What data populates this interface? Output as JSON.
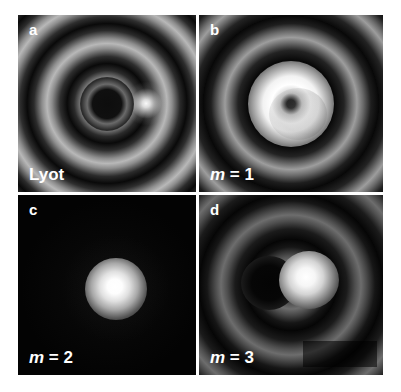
{
  "figure": {
    "background_color": "#ffffff",
    "gutter_color": "#ffffff",
    "layout": "2x2-grid",
    "panel_count": 4
  },
  "panels": [
    {
      "letter": "a",
      "caption": "Lyot",
      "caption_variable": "",
      "caption_value": "",
      "description": "concentric diffraction rings with bright off-axis spot at right"
    },
    {
      "letter": "b",
      "caption": "m = 1",
      "caption_variable": "m",
      "caption_value": "1",
      "description": "bright centered annulus with dark central core"
    },
    {
      "letter": "c",
      "caption": "m = 2",
      "caption_variable": "m",
      "caption_value": "2",
      "description": "dark field with single compact bright spot"
    },
    {
      "letter": "d",
      "caption": "m = 3",
      "caption_variable": "m",
      "caption_value": "3",
      "description": "dark void at left with bright lobe at right"
    }
  ],
  "colors": {
    "label_text": "#ffffff",
    "panel_background": "#000000",
    "page_background": "#ffffff"
  }
}
